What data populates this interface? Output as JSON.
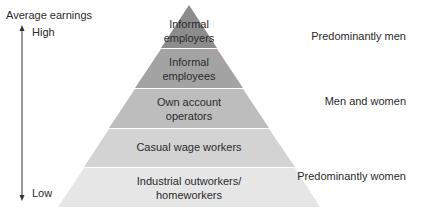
{
  "axis": {
    "title": "Average earnings",
    "high_label": "High",
    "low_label": "Low"
  },
  "pyramid": {
    "layers": [
      {
        "line1": "Informal",
        "line2": "employers",
        "color": "#8c8c8c"
      },
      {
        "line1": "Informal",
        "line2": "employees",
        "color": "#a3a3a3"
      },
      {
        "line1": "Own account",
        "line2": "operators",
        "color": "#bdbdbd"
      },
      {
        "line1": "Casual wage workers",
        "line2": "",
        "color": "#d3d3d3"
      },
      {
        "line1": "Industrial outworkers/",
        "line2": "homeworkers",
        "color": "#e6e6e6"
      }
    ]
  },
  "gender_labels": {
    "top": "Predominantly men",
    "middle": "Men and women",
    "bottom": "Predominantly women"
  }
}
